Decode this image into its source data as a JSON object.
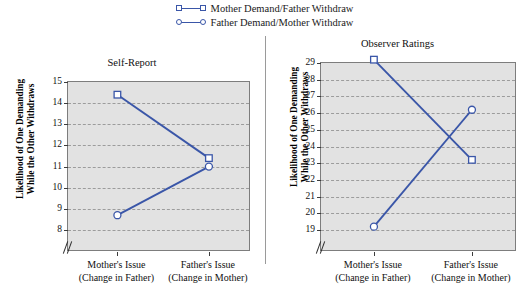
{
  "legend": {
    "position": "top-center",
    "entries": [
      {
        "marker": "open-square",
        "label": "Mother Demand/Father Withdraw",
        "color": "#3a56a8"
      },
      {
        "marker": "open-circle",
        "label": "Father Demand/Mother Withdraw",
        "color": "#3a56a8"
      }
    ]
  },
  "axis_titles": {
    "y_line1": "Likelihood of One Demanding",
    "y_line2": "While the Other Withdraws"
  },
  "categories": [
    {
      "line1": "Mother's Issue",
      "line2": "(Change in Father)"
    },
    {
      "line1": "Father's Issue",
      "line2": "(Change in Mother)"
    }
  ],
  "colors": {
    "series": "#3a56a8",
    "plot_background": "#e2e2e2",
    "gridline": "#9c9c9c",
    "axis": "#7d7d7d",
    "divider": "#9a9a9a"
  },
  "chart_data": [
    {
      "type": "line",
      "title": "Self-Report",
      "xlabel": "",
      "ylabel": "Likelihood of One Demanding While the Other Withdraws",
      "categories": [
        "Mother's Issue (Change in Father)",
        "Father's Issue (Change in Mother)"
      ],
      "yticks": [
        15,
        14,
        13,
        12,
        11,
        10,
        9,
        8
      ],
      "ylim": [
        8,
        15
      ],
      "axis_break": true,
      "grid": true,
      "series": [
        {
          "name": "Mother Demand/Father Withdraw",
          "marker": "open-square",
          "values": [
            14.4,
            11.4
          ]
        },
        {
          "name": "Father Demand/Mother Withdraw",
          "marker": "open-circle",
          "values": [
            8.7,
            11.0
          ]
        }
      ]
    },
    {
      "type": "line",
      "title": "Observer Ratings",
      "xlabel": "",
      "ylabel": "Likelihood of One Demanding While the Other Withdraws",
      "categories": [
        "Mother's Issue (Change in Father)",
        "Father's Issue (Change in Mother)"
      ],
      "yticks": [
        29,
        28,
        27,
        26,
        25,
        24,
        23,
        22,
        21,
        20,
        19
      ],
      "ylim": [
        19,
        29
      ],
      "axis_break": true,
      "grid": true,
      "series": [
        {
          "name": "Mother Demand/Father Withdraw",
          "marker": "open-square",
          "values": [
            29.2,
            23.2
          ]
        },
        {
          "name": "Father Demand/Mother Withdraw",
          "marker": "open-circle",
          "values": [
            19.2,
            26.2
          ]
        }
      ]
    }
  ]
}
